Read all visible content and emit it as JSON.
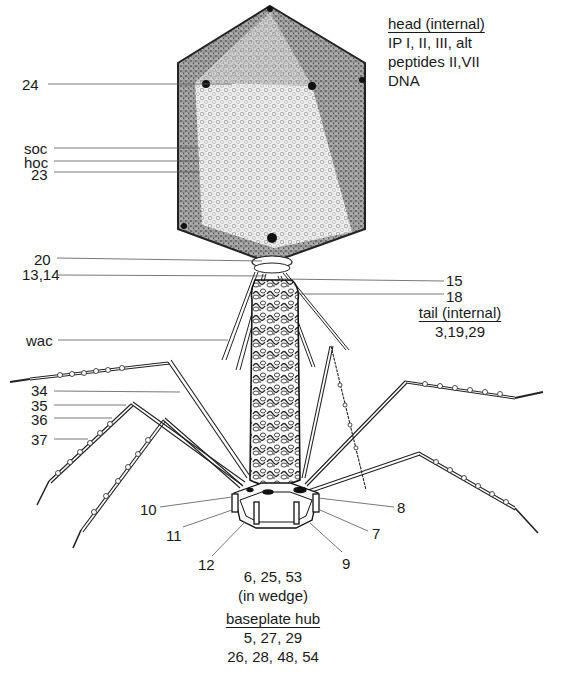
{
  "figure": {
    "head_block": {
      "title": "head (internal)",
      "lines": [
        "IP I, II, III, alt",
        "peptides II,VII",
        "DNA"
      ]
    },
    "tail_block": {
      "title": "tail (internal)",
      "lines": [
        "3,19,29"
      ]
    },
    "wedge_block": {
      "lines": [
        "6, 25, 53",
        "(in wedge)"
      ]
    },
    "hub_block": {
      "title": "baseplate hub",
      "lines": [
        "5, 27, 29",
        "26, 28, 48, 54"
      ]
    },
    "left_labels": [
      {
        "text": "24",
        "x": 22,
        "y": 77,
        "line": [
          48,
          84,
          232,
          84
        ]
      },
      {
        "text": "soc",
        "x": 24,
        "y": 141,
        "line": [
          54,
          148,
          200,
          148
        ]
      },
      {
        "text": "hoc",
        "x": 24,
        "y": 155,
        "line": [
          54,
          161,
          200,
          161
        ]
      },
      {
        "text": "23",
        "x": 31,
        "y": 167,
        "line": [
          54,
          172,
          200,
          172
        ]
      },
      {
        "text": "20",
        "x": 34,
        "y": 252,
        "line": [
          57,
          258,
          262,
          261
        ]
      },
      {
        "text": "13,14",
        "x": 22,
        "y": 267,
        "line": [
          58,
          275,
          265,
          276
        ]
      },
      {
        "text": "wac",
        "x": 26,
        "y": 333,
        "line": [
          58,
          340,
          228,
          340
        ]
      },
      {
        "text": "34",
        "x": 31,
        "y": 383,
        "line": [
          54,
          391,
          180,
          392
        ]
      },
      {
        "text": "35",
        "x": 31,
        "y": 398,
        "line": [
          54,
          405,
          126,
          405
        ]
      },
      {
        "text": "36",
        "x": 31,
        "y": 412,
        "line": [
          54,
          418,
          112,
          418
        ]
      },
      {
        "text": "37",
        "x": 31,
        "y": 432,
        "line": [
          54,
          439,
          88,
          439
        ]
      },
      {
        "text": "10",
        "x": 140,
        "y": 502,
        "line": [
          160,
          507,
          232,
          497
        ]
      },
      {
        "text": "11",
        "x": 166,
        "y": 528,
        "line": [
          183,
          527,
          232,
          510
        ]
      },
      {
        "text": "12",
        "x": 198,
        "y": 557,
        "line": [
          212,
          556,
          245,
          522
        ]
      }
    ],
    "right_labels": [
      {
        "text": "15",
        "x": 446,
        "y": 273,
        "line": [
          280,
          279,
          444,
          281
        ]
      },
      {
        "text": "18",
        "x": 446,
        "y": 289,
        "line": [
          300,
          294,
          444,
          294
        ]
      },
      {
        "text": "8",
        "x": 397,
        "y": 500,
        "line": [
          318,
          498,
          394,
          507
        ]
      },
      {
        "text": "7",
        "x": 372,
        "y": 526,
        "line": [
          320,
          510,
          368,
          531
        ]
      },
      {
        "text": "9",
        "x": 342,
        "y": 556,
        "line": [
          310,
          523,
          342,
          552
        ]
      }
    ],
    "colors": {
      "ink": "#1a1a1a",
      "leader": "#555555",
      "head_fill": "#bdbdbd",
      "head_face_light": "#ededed",
      "tail_fill": "#f2f2f2",
      "paper": "#ffffff"
    }
  }
}
